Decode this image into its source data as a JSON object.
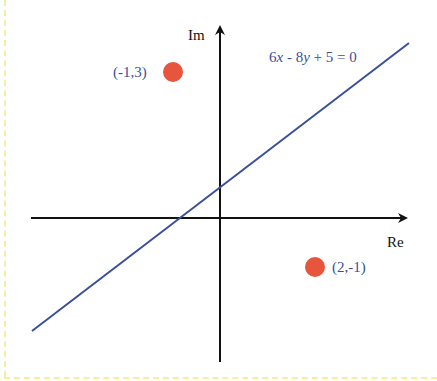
{
  "diagram": {
    "axes": {
      "x_label": "Re",
      "y_label": "Im"
    },
    "line": {
      "equation_parts": [
        "6",
        "x",
        " - 8",
        "y",
        " + 5 = 0"
      ],
      "equation": "6x - 8y + 5 = 0",
      "color": "#3b4f9a"
    },
    "points": [
      {
        "label": "(-1,3)",
        "x": -1,
        "y": 3,
        "color": "#e8553d"
      },
      {
        "label": "(2,-1)",
        "x": 2,
        "y": -1,
        "color": "#e8553d"
      }
    ],
    "colors": {
      "axis": "#111111",
      "line": "#3b4f9a",
      "point": "#e8553d",
      "label": "#3b4f9a",
      "frame": "#f5f0a0"
    }
  }
}
